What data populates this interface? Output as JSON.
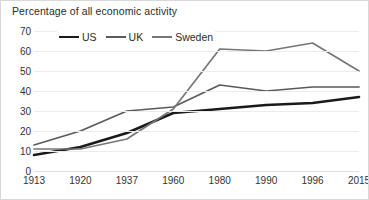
{
  "chart_data": {
    "type": "line",
    "title": "Percentage of all economic activity",
    "xlabel": "",
    "ylabel": "",
    "categories": [
      "1913",
      "1920",
      "1937",
      "1960",
      "1980",
      "1990",
      "1996",
      "2015"
    ],
    "series": [
      {
        "name": "US",
        "color": "#1a1a1a",
        "width": 2.6,
        "values": [
          8,
          12,
          19,
          29,
          31,
          33,
          34,
          37
        ]
      },
      {
        "name": "UK",
        "color": "#5a5a5a",
        "width": 1.7,
        "values": [
          13,
          20,
          30,
          32,
          43,
          40,
          42,
          42
        ]
      },
      {
        "name": "Sweden",
        "color": "#767676",
        "width": 1.7,
        "values": [
          11,
          11,
          16,
          31,
          61,
          60,
          64,
          50
        ]
      }
    ],
    "ylim": [
      0,
      70
    ],
    "yticks": [
      0,
      10,
      20,
      30,
      40,
      50,
      60,
      70
    ],
    "grid": true,
    "legend_position": "top-left"
  }
}
